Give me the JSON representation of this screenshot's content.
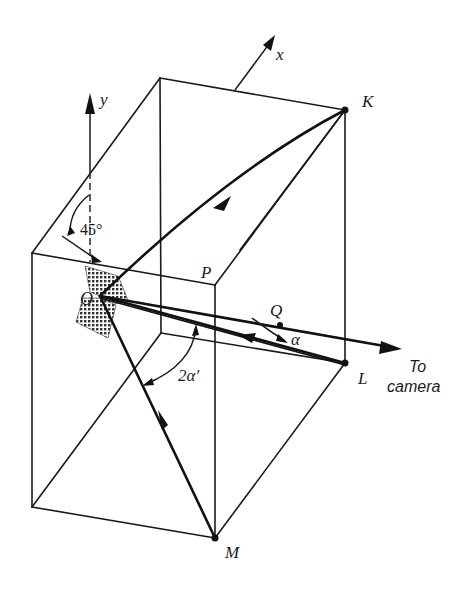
{
  "figure": {
    "type": "3D corner-cube retroreflector geometry",
    "colors": {
      "ink": "#1a1a1a",
      "background": "#ffffff",
      "hatch": "#333333"
    }
  },
  "labels": {
    "x_axis": "x",
    "y_axis": "y",
    "angle_45": "45°",
    "point_O": "O",
    "point_P": "P",
    "point_Q": "Q",
    "point_K": "K",
    "point_L": "L",
    "point_M": "M",
    "angle_alpha": "α",
    "angle_2alpha_prime": "2α′",
    "to_camera_line1": "To",
    "to_camera_line2": "camera"
  },
  "vertices": {
    "front_top_left": [
      32,
      253
    ],
    "P": [
      215,
      285
    ],
    "K": [
      345,
      110
    ],
    "back_top_left": [
      160,
      78
    ],
    "front_bottom_left": [
      32,
      507
    ],
    "M": [
      215,
      538
    ],
    "L": [
      345,
      363
    ],
    "back_bottom_hidden": [
      161,
      333
    ],
    "O": [
      100,
      296
    ],
    "Q": [
      280,
      325
    ]
  },
  "rays": [
    {
      "from": "K",
      "to": "O",
      "style": "thick",
      "arrow_toward": "O"
    },
    {
      "from": "O",
      "to": "L",
      "style": "thick"
    },
    {
      "from": "L",
      "to": "O",
      "style": "thin",
      "arrow_toward": "O"
    },
    {
      "from": "M",
      "to": "O",
      "style": "thick",
      "arrow_toward": "O"
    },
    {
      "from": "O",
      "to": "camera",
      "style": "thick",
      "via": "Q",
      "arrow_toward": "camera"
    }
  ],
  "axes": [
    {
      "name": "y",
      "direction": "up",
      "origin": [
        88,
        252
      ]
    },
    {
      "name": "x",
      "direction": "up-right",
      "origin": [
        235,
        90
      ]
    }
  ],
  "annotations": [
    {
      "text": "45°",
      "meaning": "mirror tilted 45° from y axis"
    },
    {
      "text": "α",
      "meaning": "angle between returning ray and ray to camera at Q"
    },
    {
      "text": "2α′",
      "meaning": "angle between incoming and outgoing rays at O"
    }
  ]
}
